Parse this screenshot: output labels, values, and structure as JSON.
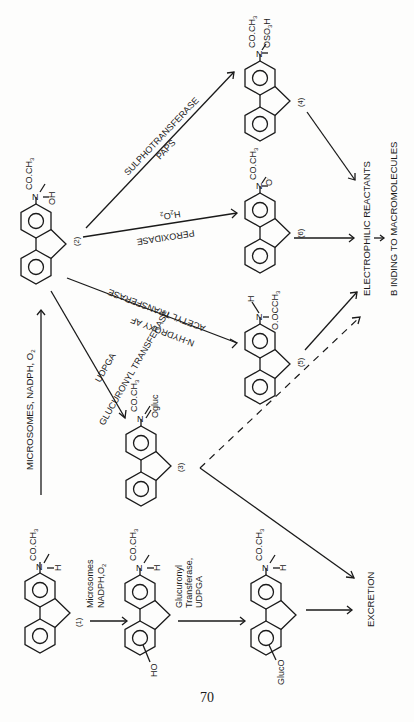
{
  "page": {
    "page_number": "70",
    "orientation": "rotated-90-ccw"
  },
  "compounds": {
    "c1": {
      "id": "(1)",
      "n_sub_top": "CO.CH",
      "n_sub_top_sub": "3",
      "n_sub_side": "H"
    },
    "c_ho": {
      "ring_sub": "HO",
      "n_sub_top": "CO.CH",
      "n_sub_top_sub": "3",
      "n_sub_side": "H"
    },
    "c_gluco": {
      "ring_sub": "GlucO",
      "n_sub_top": "CO.CH",
      "n_sub_top_sub": "3",
      "n_sub_side": "H"
    },
    "c2": {
      "id": "(2)",
      "n_sub_top": "CO.CH",
      "n_sub_top_sub": "3",
      "n_sub_side": "OH"
    },
    "c3": {
      "id": "(3)",
      "n_sub_top": "CO.CH",
      "n_sub_top_sub": "3",
      "n_sub_side": "Ogluc"
    },
    "c4": {
      "id": "(4)",
      "n_sub_top": "CO.CH",
      "n_sub_top_sub": "3",
      "n_sub_side": "OSO",
      "n_sub_side_sub": "3",
      "n_sub_side_tail": "H"
    },
    "c5": {
      "id": "(5)",
      "n_sub_top": "H",
      "n_sub_side": "O.OCCH",
      "n_sub_side_sub": "3"
    },
    "c6": {
      "id": "(6)",
      "n_sub_top": "CO.CH",
      "n_sub_top_sub": "3",
      "n_sub_side": "O",
      "n_sub_side_sup": "."
    }
  },
  "reactions": {
    "r_1_to_2": {
      "label": "MICROSOMES,  NADPH,  O",
      "label_sub": "2"
    },
    "r_1_to_ho": {
      "line1": "Microsomes",
      "line2": "NADPH,O",
      "line2_sub": "2"
    },
    "r_ho_to_gluco": {
      "line1": "Glucuronyl",
      "line2": "Transferase,",
      "line3": "UDPGA"
    },
    "r_2_to_3": {
      "line1": "GLUCURONYL TRANSFERASE",
      "line2": "UDPGA"
    },
    "r_2_to_4": {
      "line1": "SULPHOTRANSFERASE",
      "line2": "PAPS"
    },
    "r_2_to_6": {
      "line1": "H",
      "line1_sub": "2",
      "line1_tail": "O",
      "line1_tail_sub": "2",
      "line2": "PEROXIDASE"
    },
    "r_2_to_5": {
      "line1": "ACETYL TRANSFERASE",
      "line2": "N-HYDROXY AF"
    }
  },
  "outcomes": {
    "electrophilic": "ELECTROPHILIC REACTANTS",
    "binding": "B INDING TO MACROMOLECULES",
    "excretion": "EXCRETION"
  }
}
